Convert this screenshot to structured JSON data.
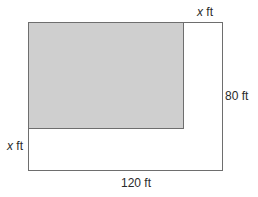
{
  "diagram": {
    "outer_rect": {
      "width_label": "120 ft",
      "height_label": "80 ft",
      "fill": "#ffffff",
      "stroke": "#6e6e6e"
    },
    "inner_rect": {
      "fill": "#cfcfcf",
      "stroke": "#6e6e6e"
    },
    "labels": {
      "top_width_var": "x",
      "top_width_unit": " ft",
      "right_height": "80 ft",
      "left_height_var": "x",
      "left_height_unit": " ft",
      "bottom_width": "120 ft"
    }
  }
}
